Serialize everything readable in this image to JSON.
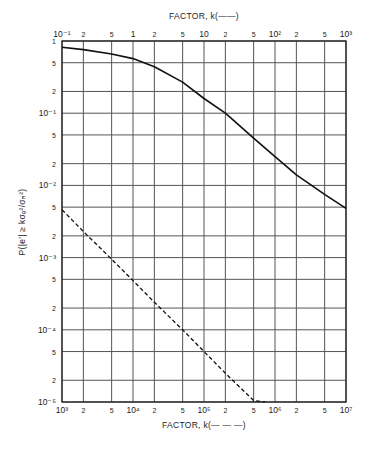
{
  "chart_data": {
    "type": "line",
    "title": "",
    "top_xlabel": "FACTOR, k(——)",
    "bottom_xlabel": "FACTOR, k(— — —)",
    "ylabel": "P(|e'| ≥ kσₑ²/σₙ²)",
    "xscale": "log",
    "yscale": "log",
    "top_xlim": [
      0.1,
      1000
    ],
    "bottom_xlim": [
      1000,
      10000000
    ],
    "ylim": [
      1e-05,
      1
    ],
    "grid": true,
    "top_x_ticks": [
      "10⁻¹",
      "2",
      "5",
      "1",
      "2",
      "5",
      "10",
      "2",
      "5",
      "10²",
      "2",
      "5",
      "10³"
    ],
    "bottom_x_ticks": [
      "10³",
      "2",
      "5",
      "10⁴",
      "2",
      "5",
      "10⁵",
      "2",
      "5",
      "10⁶",
      "2",
      "5",
      "10⁷"
    ],
    "y_ticks": [
      "1",
      "5",
      "2",
      "10⁻¹",
      "5",
      "2",
      "10⁻²",
      "5",
      "2",
      "10⁻³",
      "5",
      "2",
      "10⁻⁴",
      "5",
      "2",
      "10⁻⁵"
    ],
    "series": [
      {
        "name": "solid (top axis k)",
        "style": "solid",
        "axis": "top",
        "x": [
          0.1,
          0.2,
          0.5,
          1,
          2,
          5,
          10,
          20,
          50,
          100,
          200,
          500,
          1000
        ],
        "y": [
          0.82,
          0.76,
          0.66,
          0.57,
          0.44,
          0.27,
          0.16,
          0.1,
          0.045,
          0.025,
          0.014,
          0.0075,
          0.0048
        ]
      },
      {
        "name": "dashed (bottom axis k)",
        "style": "dashed",
        "axis": "bottom",
        "x": [
          1000,
          2000,
          5000,
          10000,
          20000,
          50000,
          100000,
          200000,
          500000,
          720000
        ],
        "y": [
          0.0046,
          0.0023,
          0.00095,
          0.00048,
          0.00024,
          0.0001,
          5e-05,
          2.5e-05,
          1.05e-05,
          1e-05
        ]
      }
    ]
  }
}
